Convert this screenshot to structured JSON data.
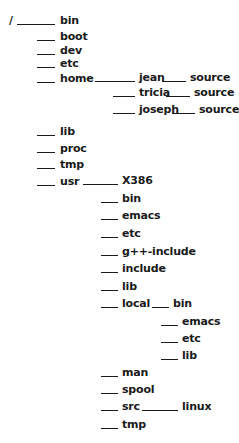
{
  "diagram": {
    "root": "/",
    "nodes": [
      {
        "id": "root",
        "label": "/",
        "x": 9,
        "y": 15
      },
      {
        "id": "bin",
        "label": "bin",
        "x": 60,
        "y": 15,
        "edge": [
          17,
          55
        ]
      },
      {
        "id": "boot",
        "label": "boot",
        "x": 60,
        "y": 31,
        "edge": [
          37,
          55
        ]
      },
      {
        "id": "dev",
        "label": "dev",
        "x": 60,
        "y": 45,
        "edge": [
          37,
          55
        ]
      },
      {
        "id": "etc",
        "label": "etc",
        "x": 60,
        "y": 58,
        "edge": [
          37,
          55
        ]
      },
      {
        "id": "home",
        "label": "home",
        "x": 60,
        "y": 73,
        "edge": [
          37,
          55
        ]
      },
      {
        "id": "home-jean",
        "label": "jean",
        "x": 139,
        "y": 72,
        "edge": [
          95,
          135
        ]
      },
      {
        "id": "home-jean-source",
        "label": "source",
        "x": 190,
        "y": 72,
        "edge": [
          162,
          186
        ]
      },
      {
        "id": "home-tricia",
        "label": "tricia",
        "x": 139,
        "y": 87,
        "edge": [
          113,
          135
        ]
      },
      {
        "id": "home-tricia-source",
        "label": "source",
        "x": 194,
        "y": 87,
        "edge": [
          166,
          190
        ]
      },
      {
        "id": "home-joseph",
        "label": "joseph",
        "x": 139,
        "y": 104,
        "edge": [
          113,
          135
        ]
      },
      {
        "id": "home-joseph-source",
        "label": "source",
        "x": 199,
        "y": 104,
        "edge": [
          172,
          195
        ]
      },
      {
        "id": "lib",
        "label": "lib",
        "x": 60,
        "y": 126,
        "edge": [
          37,
          55
        ]
      },
      {
        "id": "proc",
        "label": "proc",
        "x": 60,
        "y": 143,
        "edge": [
          37,
          55
        ]
      },
      {
        "id": "tmp",
        "label": "tmp",
        "x": 60,
        "y": 159,
        "edge": [
          37,
          55
        ]
      },
      {
        "id": "usr",
        "label": "usr",
        "x": 60,
        "y": 176,
        "edge": [
          37,
          55
        ]
      },
      {
        "id": "usr-X386",
        "label": "X386",
        "x": 122,
        "y": 175,
        "edge": [
          83,
          118
        ]
      },
      {
        "id": "usr-bin",
        "label": "bin",
        "x": 122,
        "y": 193,
        "edge": [
          101,
          118
        ]
      },
      {
        "id": "usr-emacs",
        "label": "emacs",
        "x": 122,
        "y": 210,
        "edge": [
          101,
          118
        ]
      },
      {
        "id": "usr-etc",
        "label": "etc",
        "x": 122,
        "y": 228,
        "edge": [
          101,
          118
        ]
      },
      {
        "id": "usr-g++-include",
        "label": "g++-include",
        "x": 122,
        "y": 246,
        "edge": [
          101,
          118
        ]
      },
      {
        "id": "usr-include",
        "label": "include",
        "x": 122,
        "y": 263,
        "edge": [
          101,
          118
        ]
      },
      {
        "id": "usr-lib",
        "label": "lib",
        "x": 122,
        "y": 281,
        "edge": [
          101,
          118
        ]
      },
      {
        "id": "usr-local",
        "label": "local",
        "x": 122,
        "y": 298,
        "edge": [
          101,
          118
        ]
      },
      {
        "id": "usr-local-bin",
        "label": "bin",
        "x": 173,
        "y": 298,
        "edge": [
          152,
          169
        ]
      },
      {
        "id": "usr-local-emacs",
        "label": "emacs",
        "x": 182,
        "y": 316,
        "edge": [
          161,
          178
        ]
      },
      {
        "id": "usr-local-etc",
        "label": "etc",
        "x": 182,
        "y": 333,
        "edge": [
          161,
          178
        ]
      },
      {
        "id": "usr-local-lib",
        "label": "lib",
        "x": 182,
        "y": 350,
        "edge": [
          161,
          178
        ]
      },
      {
        "id": "usr-man",
        "label": "man",
        "x": 122,
        "y": 367,
        "edge": [
          101,
          118
        ]
      },
      {
        "id": "usr-spool",
        "label": "spool",
        "x": 122,
        "y": 384,
        "edge": [
          101,
          118
        ]
      },
      {
        "id": "usr-src",
        "label": "src",
        "x": 122,
        "y": 401,
        "edge": [
          101,
          118
        ]
      },
      {
        "id": "usr-src-linux",
        "label": "linux",
        "x": 182,
        "y": 401,
        "edge": [
          142,
          178
        ]
      },
      {
        "id": "usr-tmp",
        "label": "tmp",
        "x": 122,
        "y": 419,
        "edge": [
          101,
          118
        ]
      }
    ]
  }
}
